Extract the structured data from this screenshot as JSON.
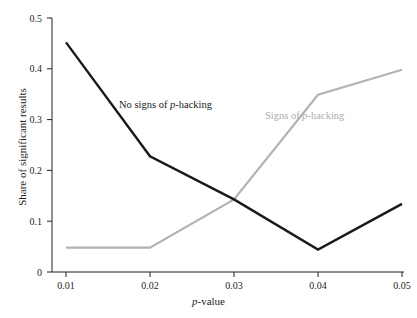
{
  "chart_data": {
    "type": "line",
    "title": "",
    "xlabel": "p-value",
    "ylabel": "Share of significant results",
    "x": [
      0.01,
      0.02,
      0.03,
      0.04,
      0.05
    ],
    "xticklabels": [
      "0.01",
      "0.02",
      "0.03",
      "0.04",
      "0.05"
    ],
    "yticks": [
      0,
      0.1,
      0.2,
      0.3,
      0.4,
      0.5
    ],
    "yticklabels": [
      "0",
      "0.1",
      "0.2",
      "0.3",
      "0.4",
      "0.5"
    ],
    "ylim": [
      0,
      0.5
    ],
    "xlim": [
      0.01,
      0.05
    ],
    "grid": false,
    "legend_position": "inline-annotations",
    "series": [
      {
        "name": "No signs of p-hacking",
        "color": "#1a1a1a",
        "values": [
          0.452,
          0.228,
          0.143,
          0.044,
          0.134
        ]
      },
      {
        "name": "Signs of p-hacking",
        "color": "#b3b3b3",
        "values": [
          0.048,
          0.048,
          0.143,
          0.349,
          0.398
        ]
      }
    ],
    "annotations": [
      {
        "text": "No signs of p-hacking",
        "color": "#1a1a1a"
      },
      {
        "text": "Signs of p-hacking",
        "color": "#adadad"
      }
    ]
  },
  "axis": {
    "x_title_italic": "p",
    "x_title_rest": "-value",
    "y_title": "Share of significant results"
  },
  "labels": {
    "no_hacking_prefix": "No signs of ",
    "no_hacking_italic": "p",
    "no_hacking_suffix": "-hacking",
    "hacking_prefix": "Signs of ",
    "hacking_italic": "p",
    "hacking_suffix": "-hacking"
  }
}
